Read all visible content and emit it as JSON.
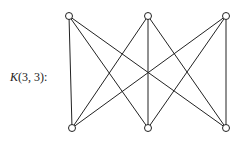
{
  "title": "K(3, 3):",
  "label_symbol": "K",
  "label_args": "(3, 3):",
  "graph": {
    "name": "K(3,3)",
    "type": "complete bipartite graph",
    "top_nodes": [
      {
        "id": "a1",
        "x": 69,
        "y": 16
      },
      {
        "id": "a2",
        "x": 148,
        "y": 16
      },
      {
        "id": "a3",
        "x": 226,
        "y": 16
      }
    ],
    "bottom_nodes": [
      {
        "id": "b1",
        "x": 72,
        "y": 128
      },
      {
        "id": "b2",
        "x": 148,
        "y": 128
      },
      {
        "id": "b3",
        "x": 226,
        "y": 128
      }
    ],
    "edge_color": "#222222",
    "node_fill": "#ffffff"
  }
}
